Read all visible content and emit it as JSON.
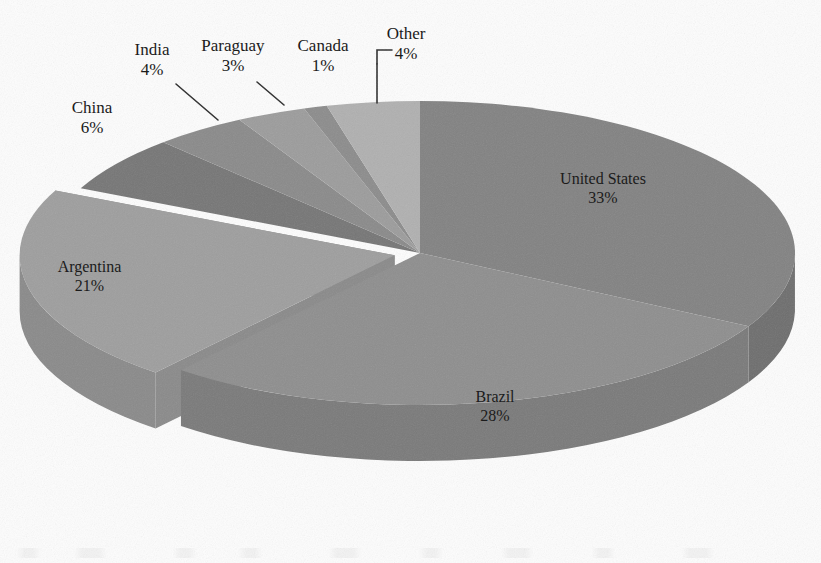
{
  "chart_data": {
    "type": "pie",
    "title": "",
    "subtitle": "",
    "xlabel": "",
    "ylabel": "",
    "style": "3d-exploded-grayscale",
    "legend_position": "none",
    "label_format": "name + percent",
    "grid": false,
    "categories": [
      "United States",
      "Brazil",
      "Argentina",
      "China",
      "India",
      "Paraguay",
      "Canada",
      "Other"
    ],
    "values": [
      33,
      28,
      21,
      6,
      4,
      3,
      1,
      4
    ],
    "unit": "%",
    "slices": [
      {
        "name": "United States",
        "percent": 33,
        "label": "United States",
        "percent_label": "33%",
        "color": "#828282",
        "side_color": "#6e6e6e",
        "exploded": false,
        "leader_line": false,
        "label_placement": "inside"
      },
      {
        "name": "Brazil",
        "percent": 28,
        "label": "Brazil",
        "percent_label": "28%",
        "color": "#8e8e8e",
        "side_color": "#7a7a7a",
        "exploded": false,
        "leader_line": false,
        "label_placement": "inside"
      },
      {
        "name": "Argentina",
        "percent": 21,
        "label": "Argentina",
        "percent_label": "21%",
        "color": "#9e9e9e",
        "side_color": "#8a8a8a",
        "exploded": true,
        "leader_line": false,
        "label_placement": "inside"
      },
      {
        "name": "China",
        "percent": 6,
        "label": "China",
        "percent_label": "6%",
        "color": "#767676",
        "side_color": "#666666",
        "exploded": false,
        "leader_line": false,
        "label_placement": "outside"
      },
      {
        "name": "India",
        "percent": 4,
        "label": "India",
        "percent_label": "4%",
        "color": "#8a8a8a",
        "side_color": "#787878",
        "exploded": false,
        "leader_line": true,
        "label_placement": "outside"
      },
      {
        "name": "Paraguay",
        "percent": 3,
        "label": "Paraguay",
        "percent_label": "3%",
        "color": "#9c9c9c",
        "side_color": "#888888",
        "exploded": false,
        "leader_line": true,
        "label_placement": "outside"
      },
      {
        "name": "Canada",
        "percent": 1,
        "label": "Canada",
        "percent_label": "1%",
        "color": "#8c8c8c",
        "side_color": "#7a7a7a",
        "exploded": false,
        "leader_line": false,
        "label_placement": "outside"
      },
      {
        "name": "Other",
        "percent": 4,
        "label": "Other",
        "percent_label": "4%",
        "color": "#b0b0b0",
        "side_color": "#9a9a9a",
        "exploded": false,
        "leader_line": true,
        "label_placement": "outside"
      }
    ]
  },
  "labels": {
    "united_states": {
      "name": "United States",
      "percent": "33%"
    },
    "brazil": {
      "name": "Brazil",
      "percent": "28%"
    },
    "argentina": {
      "name": "Argentina",
      "percent": "21%"
    },
    "china": {
      "name": "China",
      "percent": "6%"
    },
    "india": {
      "name": "India",
      "percent": "4%"
    },
    "paraguay": {
      "name": "Paraguay",
      "percent": "3%"
    },
    "canada": {
      "name": "Canada",
      "percent": "1%"
    },
    "other": {
      "name": "Other",
      "percent": "4%"
    }
  },
  "colors": {
    "background": "#ffffff",
    "text": "#1b1b1b",
    "leader_line": "#2a2a2a"
  }
}
